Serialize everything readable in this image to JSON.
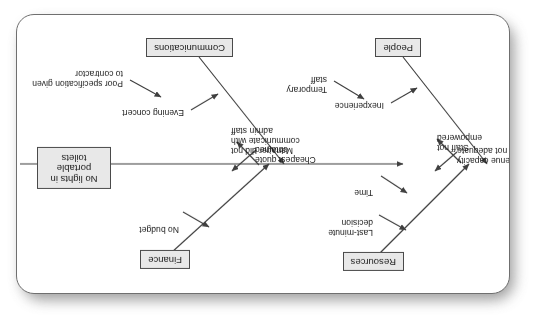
{
  "diagram": {
    "type": "fishbone-ishikawa",
    "orientation": "rotated-180",
    "effect": "No lights in portable toilets",
    "categories": [
      {
        "name": "Finance",
        "position": "top-left",
        "causes": [
          "No budget",
          "Cheapest quote\nobtained"
        ]
      },
      {
        "name": "Resources",
        "position": "top-right",
        "causes": [
          "Last-minute\ndecision",
          "Time",
          "Venue capacity\nnot adequate"
        ]
      },
      {
        "name": "Communications",
        "position": "bottom-left",
        "causes": [
          "Evening concert",
          "Manager did not\ncommunicate with\nadmin staff",
          "Poor specification given\nto contractor"
        ]
      },
      {
        "name": "People",
        "position": "bottom-right",
        "causes": [
          "Inexperience",
          "Temporary\nstaff",
          "Staff not empowered"
        ]
      }
    ]
  },
  "colors": {
    "box_fill": "#e8e8e8",
    "box_border": "#4a4a4a",
    "line": "#3f3f3f",
    "card_bg": "#ffffff",
    "card_border": "#6f6f6f",
    "shadow": "#8d8d8d",
    "text": "#1a1a1a"
  }
}
